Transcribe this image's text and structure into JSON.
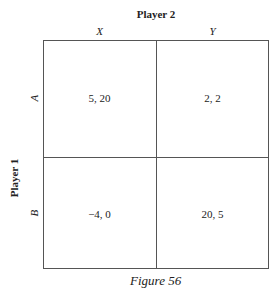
{
  "figure": {
    "caption": "Figure 56",
    "column_player": "Player 2",
    "row_player": "Player 1",
    "columns": [
      "X",
      "Y"
    ],
    "rows": [
      "A",
      "B"
    ],
    "payoffs": [
      [
        "5, 20",
        "2, 2"
      ],
      [
        "−4, 0",
        "20, 5"
      ]
    ]
  }
}
